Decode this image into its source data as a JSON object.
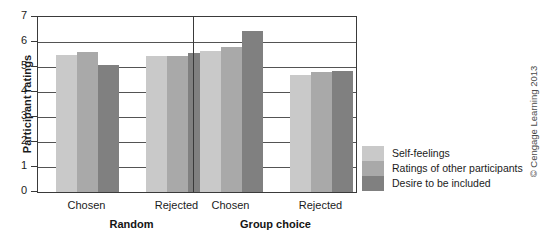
{
  "chart_data": {
    "type": "bar",
    "title": "",
    "xlabel": "",
    "ylabel": "Participant ratings",
    "ylim": [
      0,
      7
    ],
    "yticks": [
      0,
      1,
      2,
      3,
      4,
      5,
      6,
      7
    ],
    "ytick_labels": [
      "0",
      "1",
      "2",
      "3",
      "4",
      "5",
      "6",
      "7"
    ],
    "grid": true,
    "legend_position": "right",
    "groups": [
      {
        "label": "Random",
        "categories": [
          "Chosen",
          "Rejected"
        ]
      },
      {
        "label": "Group choice",
        "categories": [
          "Chosen",
          "Rejected"
        ]
      }
    ],
    "categories": [
      "Chosen",
      "Rejected",
      "Chosen",
      "Rejected"
    ],
    "series": [
      {
        "name": "Self-feelings",
        "color": "#c9c9c9",
        "values": [
          5.5,
          5.45,
          5.65,
          4.7
        ]
      },
      {
        "name": "Ratings of other participants",
        "color": "#a9a9a9",
        "values": [
          5.6,
          5.45,
          5.8,
          4.8
        ]
      },
      {
        "name": "Desire to be included",
        "color": "#808080",
        "values": [
          5.1,
          5.55,
          6.45,
          4.85
        ]
      }
    ]
  },
  "axis": {
    "y_title": "Participant ratings",
    "y_tick_labels": [
      "7",
      "6",
      "5",
      "4",
      "3",
      "2",
      "1",
      "0"
    ]
  },
  "x_axis": {
    "category_labels": [
      "Chosen",
      "Rejected",
      "Chosen",
      "Rejected"
    ],
    "group_labels": [
      "Random",
      "Group choice"
    ]
  },
  "legend": {
    "items": [
      {
        "label": "Self-feelings",
        "color": "#c9c9c9"
      },
      {
        "label": "Ratings of other participants",
        "color": "#a9a9a9"
      },
      {
        "label": "Desire to be included",
        "color": "#808080"
      }
    ]
  },
  "credit": {
    "text": "© Cengage Learning 2013"
  }
}
